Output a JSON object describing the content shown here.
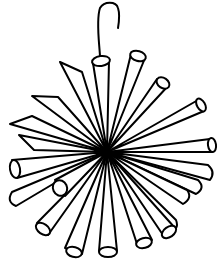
{
  "illustration": {
    "subject": "straw-star-ornament",
    "alt": "Line drawing of a hanging ornament made of tubes radiating from a central point with a hook on top",
    "colors": {
      "line": "#000000",
      "background": "#ffffff"
    }
  }
}
